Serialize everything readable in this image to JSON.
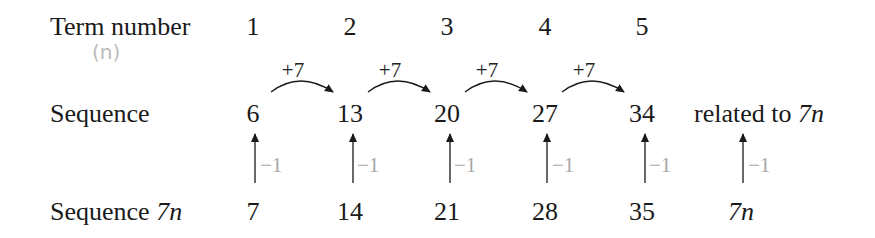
{
  "rows": {
    "term_label": "Term number",
    "term_note": "(n)",
    "sequence_label": "Sequence",
    "seq7n_label_prefix": "Sequence ",
    "seq7n_label_var": "7n"
  },
  "terms": [
    "1",
    "2",
    "3",
    "4",
    "5"
  ],
  "sequence": [
    "6",
    "13",
    "20",
    "27",
    "34"
  ],
  "differences": [
    "+7",
    "+7",
    "+7",
    "+7"
  ],
  "sequence_7n": [
    "7",
    "14",
    "21",
    "28",
    "35"
  ],
  "adjustments": [
    "−1",
    "−1",
    "−1",
    "−1",
    "−1",
    "−1"
  ],
  "general": {
    "related_prefix": "related to ",
    "related_var": "7n",
    "formula": "7n"
  },
  "colors": {
    "text": "#1a1a1a",
    "adjust": "#a8a8a8",
    "annotation": "#bbbbbb"
  }
}
